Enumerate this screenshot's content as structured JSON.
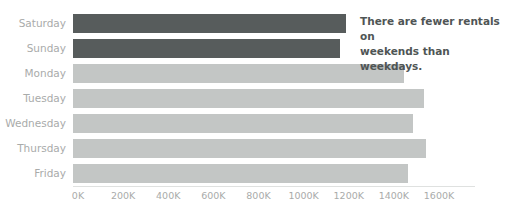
{
  "chart_data": {
    "type": "bar",
    "orientation": "horizontal",
    "title": "",
    "xlabel": "",
    "ylabel": "",
    "categories": [
      "Saturday",
      "Sunday",
      "Monday",
      "Tuesday",
      "Wednesday",
      "Thursday",
      "Friday"
    ],
    "values": [
      1210,
      1185,
      1465,
      1555,
      1505,
      1565,
      1485
    ],
    "value_unit": "K",
    "xlim": [
      0,
      1600
    ],
    "xticks": [
      0,
      200,
      400,
      600,
      800,
      1000,
      1200,
      1400,
      1600
    ],
    "xticklabels": [
      "0K",
      "200K",
      "400K",
      "600K",
      "800K",
      "1000K",
      "1200K",
      "1400K",
      "1600K"
    ],
    "grid": false,
    "legend": "none",
    "series": [
      {
        "name": "Rentals",
        "values": [
          1210,
          1185,
          1465,
          1555,
          1505,
          1565,
          1485
        ]
      }
    ],
    "bars": [
      {
        "category": "Saturday",
        "value": 1210,
        "highlight": true,
        "color": "#575c5c"
      },
      {
        "category": "Sunday",
        "value": 1185,
        "highlight": true,
        "color": "#575c5c"
      },
      {
        "category": "Monday",
        "value": 1465,
        "highlight": false,
        "color": "#c3c6c5"
      },
      {
        "category": "Tuesday",
        "value": 1555,
        "highlight": false,
        "color": "#c3c6c5"
      },
      {
        "category": "Wednesday",
        "value": 1505,
        "highlight": false,
        "color": "#c3c6c5"
      },
      {
        "category": "Thursday",
        "value": 1565,
        "highlight": false,
        "color": "#c3c6c5"
      },
      {
        "category": "Friday",
        "value": 1485,
        "highlight": false,
        "color": "#c3c6c5"
      }
    ],
    "annotations": [
      {
        "line1": "There are fewer rentals on",
        "line2": "weekends than weekdays."
      }
    ]
  },
  "colors": {
    "highlight_bar": "#575c5c",
    "muted_bar": "#c3c6c5",
    "tick_text": "#a9abaa",
    "category_text": "#a9abaa",
    "annotation_text": "#4f5555",
    "axis_line": "#dfe1e0",
    "background": "#ffffff"
  },
  "clipped_title": ""
}
